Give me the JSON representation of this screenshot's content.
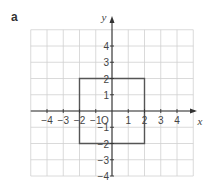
{
  "part_label": "a",
  "chart_data": {
    "type": "diagram",
    "title": "",
    "xlabel": "x",
    "ylabel": "y",
    "origin_label": "O",
    "xlim": [
      -5,
      5
    ],
    "ylim": [
      -4,
      5
    ],
    "grid": true,
    "x_ticks": [
      -4,
      -3,
      -2,
      -1,
      1,
      2,
      3,
      4
    ],
    "y_ticks": [
      4,
      3,
      2,
      1,
      -1,
      -2,
      -3,
      -4
    ],
    "shapes": [
      {
        "type": "square",
        "vertices": [
          [
            -2,
            2
          ],
          [
            2,
            2
          ],
          [
            2,
            -2
          ],
          [
            -2,
            -2
          ]
        ],
        "color": "#555555"
      }
    ]
  },
  "colors": {
    "grid": "#d0d0d0",
    "axis": "#333333",
    "shape": "#555555"
  }
}
